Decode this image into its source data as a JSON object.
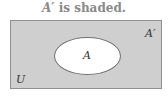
{
  "caption": {
    "set_symbol": "A′",
    "text": " is shaded."
  },
  "diagram": {
    "type": "venn",
    "universe_label": "U",
    "set_label": "A",
    "complement_label": "A′",
    "shaded_region": "A′",
    "colors": {
      "shaded": "#cfcfcf",
      "unshaded": "#ffffff",
      "border": "#8f8f8f",
      "caption": "#8a8a8a"
    }
  }
}
